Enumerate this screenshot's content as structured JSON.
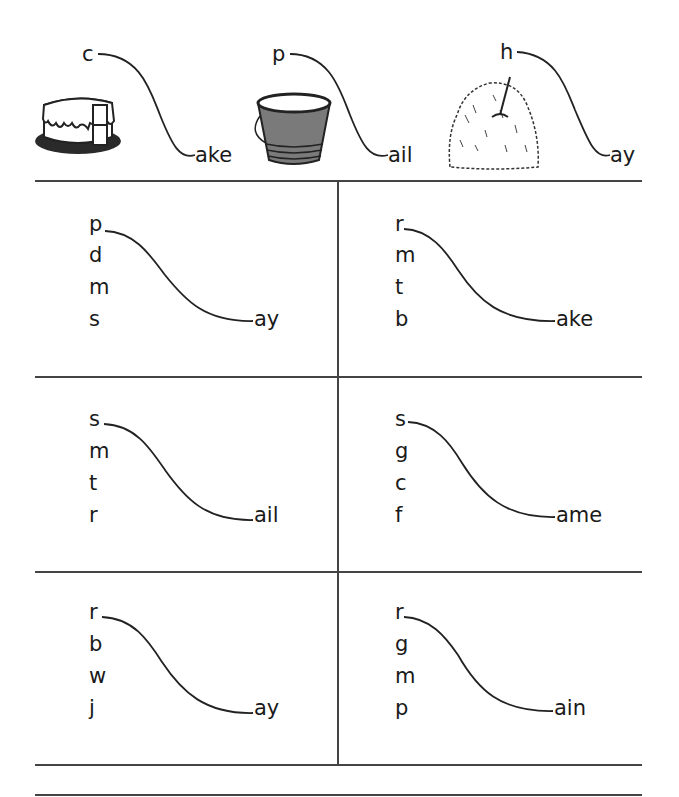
{
  "worksheet": {
    "examples": [
      {
        "letter": "c",
        "ending": "ake",
        "picture": "cake"
      },
      {
        "letter": "p",
        "ending": "ail",
        "picture": "pail"
      },
      {
        "letter": "h",
        "ending": "ay",
        "picture": "haystack"
      }
    ],
    "exercises": [
      {
        "letters": [
          "p",
          "d",
          "m",
          "s"
        ],
        "ending": "ay"
      },
      {
        "letters": [
          "r",
          "m",
          "t",
          "b"
        ],
        "ending": "ake"
      },
      {
        "letters": [
          "s",
          "m",
          "t",
          "r"
        ],
        "ending": "ail"
      },
      {
        "letters": [
          "s",
          "g",
          "c",
          "f"
        ],
        "ending": "ame"
      },
      {
        "letters": [
          "r",
          "b",
          "w",
          "j"
        ],
        "ending": "ay"
      },
      {
        "letters": [
          "r",
          "g",
          "m",
          "p"
        ],
        "ending": "ain"
      }
    ],
    "colors": {
      "ink": "#1a1a1a",
      "rule": "#444444",
      "pail": "#7a7a7a"
    }
  }
}
